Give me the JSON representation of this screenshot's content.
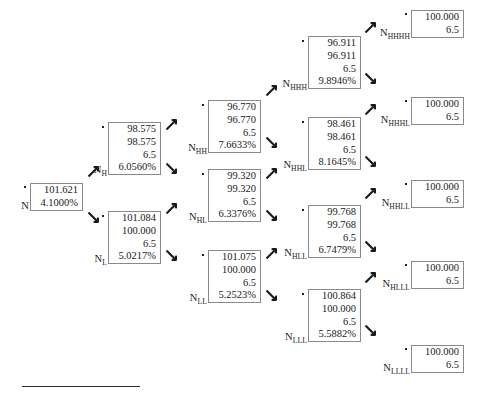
{
  "figure": {
    "type": "binomial-lattice-tree",
    "footer_rule": true
  },
  "nodes": [
    {
      "id": "N",
      "label": "N",
      "sublabel": "",
      "lines": [
        "101.621",
        "4.1000%"
      ],
      "x": 30,
      "y": 183,
      "w": 53
    },
    {
      "id": "NH",
      "label": "N",
      "sublabel": "H",
      "lines": [
        "98.575",
        "98.575",
        "6.5",
        "6.0560%"
      ],
      "x": 108,
      "y": 122,
      "w": 53
    },
    {
      "id": "NL",
      "label": "N",
      "sublabel": "L",
      "lines": [
        "101.084",
        "100.000",
        "6.5",
        "5.0217%"
      ],
      "x": 108,
      "y": 211,
      "w": 53
    },
    {
      "id": "NHH",
      "label": "N",
      "sublabel": "HH",
      "lines": [
        "96.770",
        "96.770",
        "6.5",
        "7.6633%"
      ],
      "x": 208,
      "y": 100,
      "w": 53
    },
    {
      "id": "NHL",
      "label": "N",
      "sublabel": "HL",
      "lines": [
        "99.320",
        "99.320",
        "6.5",
        "6.3376%"
      ],
      "x": 208,
      "y": 169,
      "w": 53
    },
    {
      "id": "NLL",
      "label": "N",
      "sublabel": "LL",
      "lines": [
        "101.075",
        "100.000",
        "6.5",
        "5.2523%"
      ],
      "x": 208,
      "y": 250,
      "w": 53
    },
    {
      "id": "NHHH",
      "label": "N",
      "sublabel": "HHH",
      "lines": [
        "96.911",
        "96.911",
        "6.5",
        "9.8946%"
      ],
      "x": 308,
      "y": 36,
      "w": 53
    },
    {
      "id": "NHHL",
      "label": "N",
      "sublabel": "HHL",
      "lines": [
        "98.461",
        "98.461",
        "6.5",
        "8.1645%"
      ],
      "x": 308,
      "y": 117,
      "w": 53
    },
    {
      "id": "NHLL",
      "label": "N",
      "sublabel": "HLL",
      "lines": [
        "99.768",
        "99.768",
        "6.5",
        "6.7479%"
      ],
      "x": 308,
      "y": 205,
      "w": 53
    },
    {
      "id": "NLLL",
      "label": "N",
      "sublabel": "LLL",
      "lines": [
        "100.864",
        "100.000",
        "6.5",
        "5.5882%"
      ],
      "x": 308,
      "y": 289,
      "w": 53
    },
    {
      "id": "NHHHH",
      "label": "N",
      "sublabel": "HHHH",
      "lines": [
        "100.000",
        "6.5"
      ],
      "x": 411,
      "y": 10,
      "w": 53
    },
    {
      "id": "NHHHL",
      "label": "N",
      "sublabel": "HHHL",
      "lines": [
        "100.000",
        "6.5"
      ],
      "x": 411,
      "y": 97,
      "w": 53
    },
    {
      "id": "NHHLL",
      "label": "N",
      "sublabel": "HHLL",
      "lines": [
        "100.000",
        "6.5"
      ],
      "x": 411,
      "y": 180,
      "w": 53
    },
    {
      "id": "NHLLL",
      "label": "N",
      "sublabel": "HLLL",
      "lines": [
        "100.000",
        "6.5"
      ],
      "x": 411,
      "y": 261,
      "w": 53
    },
    {
      "id": "NLLLL",
      "label": "N",
      "sublabel": "LLLL",
      "lines": [
        "100.000",
        "6.5"
      ],
      "x": 411,
      "y": 345,
      "w": 53
    }
  ],
  "arrows": [
    {
      "from": "N",
      "to": "NH",
      "dir": "up",
      "x": 88,
      "y": 166
    },
    {
      "from": "N",
      "to": "NL",
      "dir": "down",
      "x": 88,
      "y": 212
    },
    {
      "from": "NH",
      "to": "NHH",
      "dir": "up",
      "x": 166,
      "y": 119
    },
    {
      "from": "NH",
      "to": "NHL",
      "dir": "down",
      "x": 166,
      "y": 163
    },
    {
      "from": "NL",
      "to": "NHL",
      "dir": "up",
      "x": 166,
      "y": 203
    },
    {
      "from": "NL",
      "to": "NLL",
      "dir": "down",
      "x": 166,
      "y": 250
    },
    {
      "from": "NHH",
      "to": "NHHH",
      "dir": "up",
      "x": 266,
      "y": 85
    },
    {
      "from": "NHH",
      "to": "NHHL",
      "dir": "down",
      "x": 266,
      "y": 137
    },
    {
      "from": "NHL",
      "to": "NHHL",
      "dir": "up",
      "x": 266,
      "y": 168
    },
    {
      "from": "NHL",
      "to": "NHLL",
      "dir": "down",
      "x": 266,
      "y": 210
    },
    {
      "from": "NLL",
      "to": "NHLL",
      "dir": "up",
      "x": 266,
      "y": 248
    },
    {
      "from": "NLL",
      "to": "NLLL",
      "dir": "down",
      "x": 266,
      "y": 290
    },
    {
      "from": "NHHH",
      "to": "NHHHH",
      "dir": "up",
      "x": 365,
      "y": 22
    },
    {
      "from": "NHHH",
      "to": "NHHHL",
      "dir": "down",
      "x": 365,
      "y": 73
    },
    {
      "from": "NHHL",
      "to": "NHHHL",
      "dir": "up",
      "x": 365,
      "y": 104
    },
    {
      "from": "NHHL",
      "to": "NHHLL",
      "dir": "down",
      "x": 365,
      "y": 156
    },
    {
      "from": "NHLL",
      "to": "NHHLL",
      "dir": "up",
      "x": 365,
      "y": 188
    },
    {
      "from": "NHLL",
      "to": "NHLLL",
      "dir": "down",
      "x": 365,
      "y": 241
    },
    {
      "from": "NLLL",
      "to": "NHLLL",
      "dir": "up",
      "x": 365,
      "y": 272
    },
    {
      "from": "NLLL",
      "to": "NLLLL",
      "dir": "down",
      "x": 365,
      "y": 325
    }
  ]
}
